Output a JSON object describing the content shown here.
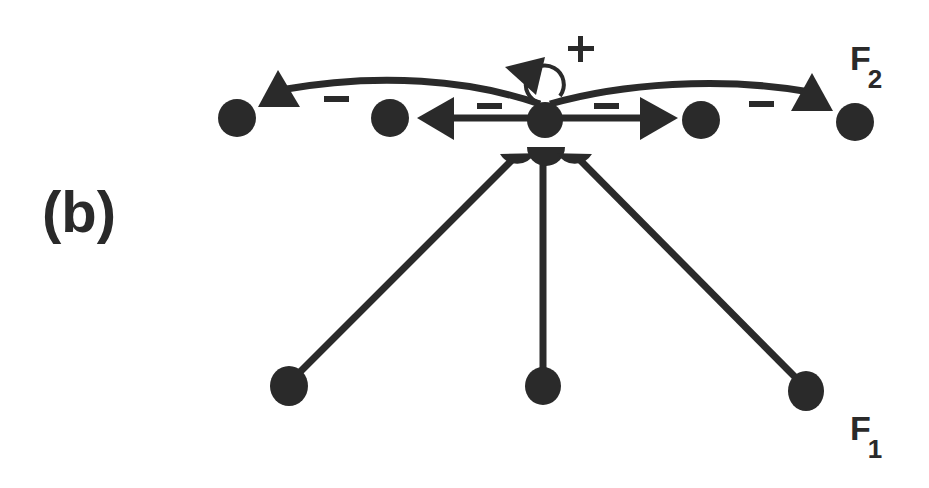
{
  "panel_label": "(b)",
  "layers": {
    "f2": {
      "name": "F",
      "subscript": "2"
    },
    "f1": {
      "name": "F",
      "subscript": "1"
    }
  },
  "signs": {
    "self_excitation": "+",
    "inhibition": "−"
  },
  "colors": {
    "ink": "#2a2a2a",
    "background": "#ffffff"
  },
  "f2_nodes": [
    {
      "id": "f2-1",
      "cx": 237,
      "cy": 118
    },
    {
      "id": "f2-2",
      "cx": 390,
      "cy": 118
    },
    {
      "id": "f2-3",
      "cx": 545,
      "cy": 120
    },
    {
      "id": "f2-4",
      "cx": 701,
      "cy": 120
    },
    {
      "id": "f2-5",
      "cx": 855,
      "cy": 122
    }
  ],
  "f1_nodes": [
    {
      "id": "f1-1",
      "cx": 289,
      "cy": 386
    },
    {
      "id": "f1-2",
      "cx": 543,
      "cy": 386
    },
    {
      "id": "f1-3",
      "cx": 806,
      "cy": 391
    }
  ],
  "connections": [
    {
      "from": "f2-3",
      "to": "f2-1",
      "type": "inhibitory",
      "sign": "−"
    },
    {
      "from": "f2-3",
      "to": "f2-2",
      "type": "inhibitory",
      "sign": "−"
    },
    {
      "from": "f2-3",
      "to": "f2-4",
      "type": "inhibitory",
      "sign": "−"
    },
    {
      "from": "f2-3",
      "to": "f2-5",
      "type": "inhibitory",
      "sign": "−"
    },
    {
      "from": "f2-3",
      "to": "f2-3",
      "type": "excitatory-self",
      "sign": "+"
    },
    {
      "from": "f1-1",
      "to": "f2-3",
      "type": "adaptive-synapse"
    },
    {
      "from": "f1-2",
      "to": "f2-3",
      "type": "adaptive-synapse"
    },
    {
      "from": "f1-3",
      "to": "f2-3",
      "type": "adaptive-synapse"
    }
  ]
}
